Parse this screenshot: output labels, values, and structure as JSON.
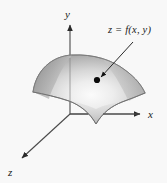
{
  "figure": {
    "background_color": "#f8f8f8",
    "axes": {
      "x_label": "x",
      "y_label": "y",
      "z_label": "z"
    },
    "annotation": {
      "label": "z = f(x, y)",
      "marker": "point-on-surface"
    },
    "surface": {
      "description": "shaded gray saddle-shaped surface",
      "fill_light": "#f2f2f2",
      "fill_mid": "#c9c9c9",
      "fill_dark": "#8d8d8d",
      "edge_color": "#6f6f6f"
    },
    "line_color": "#4a4a4a",
    "marker_color": "#0a0a0a"
  }
}
